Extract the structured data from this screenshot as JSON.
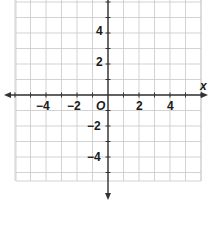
{
  "chart_data": {
    "type": "scatter",
    "title": "",
    "xlabel": "x",
    "ylabel": "",
    "origin_label": "O",
    "xlim": [
      -6,
      6
    ],
    "ylim": [
      -6,
      6
    ],
    "grid": true,
    "grid_step": 1,
    "x_tick_labels": [
      {
        "value": -4,
        "label": "−4"
      },
      {
        "value": -2,
        "label": "−2"
      },
      {
        "value": 2,
        "label": "2"
      },
      {
        "value": 4,
        "label": "4"
      }
    ],
    "y_tick_labels": [
      {
        "value": 4,
        "label": "4"
      },
      {
        "value": 2,
        "label": "2"
      },
      {
        "value": -2,
        "label": "−2"
      },
      {
        "value": -4,
        "label": "−4"
      }
    ],
    "series": [],
    "legend": null
  },
  "colors": {
    "grid": "#c8c8c8",
    "axis": "#333333",
    "text": "#1a1a1a"
  },
  "labels": {
    "x_axis_name": "x",
    "origin": "O",
    "x_neg4": "−4",
    "x_neg2": "−2",
    "x_pos2": "2",
    "x_pos4": "4",
    "y_pos4": "4",
    "y_pos2": "2",
    "y_neg2": "−2",
    "y_neg4": "−4"
  }
}
